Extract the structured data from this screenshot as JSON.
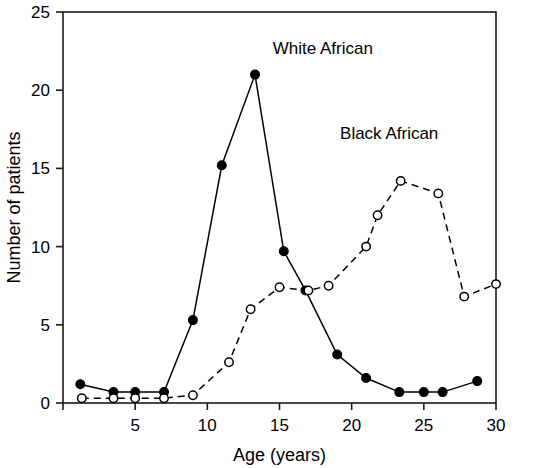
{
  "chart_data": {
    "type": "line",
    "title": "",
    "xlabel": "Age (years)",
    "ylabel": "Number of patients",
    "xlim": [
      0,
      30
    ],
    "ylim": [
      0,
      25
    ],
    "xticks": [
      0,
      5,
      10,
      15,
      20,
      25,
      30
    ],
    "xticklabels": [
      "",
      "5",
      "10",
      "15",
      "20",
      "25",
      "30"
    ],
    "yticks": [
      0,
      5,
      10,
      15,
      20,
      25
    ],
    "yticklabels": [
      "0",
      "5",
      "10",
      "15",
      "20",
      "25"
    ],
    "grid": false,
    "legend_position": "inline-annotations",
    "series": [
      {
        "name": "White African",
        "marker": "filled-circle",
        "linestyle": "solid",
        "color": "#000000",
        "label_x": 18.0,
        "label_y": 22.3,
        "points": [
          {
            "x": 1.2,
            "y": 1.2
          },
          {
            "x": 3.5,
            "y": 0.7
          },
          {
            "x": 5.0,
            "y": 0.7
          },
          {
            "x": 7.0,
            "y": 0.7
          },
          {
            "x": 9.0,
            "y": 5.3
          },
          {
            "x": 11.0,
            "y": 15.2
          },
          {
            "x": 13.3,
            "y": 21.0
          },
          {
            "x": 15.3,
            "y": 9.7
          },
          {
            "x": 16.8,
            "y": 7.2
          },
          {
            "x": 19.0,
            "y": 3.1
          },
          {
            "x": 21.0,
            "y": 1.6
          },
          {
            "x": 23.3,
            "y": 0.7
          },
          {
            "x": 25.0,
            "y": 0.7
          },
          {
            "x": 26.3,
            "y": 0.7
          },
          {
            "x": 28.7,
            "y": 1.4
          }
        ]
      },
      {
        "name": "Black African",
        "marker": "open-circle",
        "linestyle": "dashed",
        "color": "#000000",
        "label_x": 22.6,
        "label_y": 16.9,
        "points": [
          {
            "x": 1.3,
            "y": 0.3
          },
          {
            "x": 3.5,
            "y": 0.3
          },
          {
            "x": 5.0,
            "y": 0.3
          },
          {
            "x": 7.0,
            "y": 0.3
          },
          {
            "x": 9.0,
            "y": 0.5
          },
          {
            "x": 11.5,
            "y": 2.6
          },
          {
            "x": 13.0,
            "y": 6.0
          },
          {
            "x": 15.0,
            "y": 7.4
          },
          {
            "x": 17.0,
            "y": 7.2
          },
          {
            "x": 18.4,
            "y": 7.5
          },
          {
            "x": 21.0,
            "y": 10.0
          },
          {
            "x": 21.8,
            "y": 12.0
          },
          {
            "x": 23.4,
            "y": 14.2
          },
          {
            "x": 26.0,
            "y": 13.4
          },
          {
            "x": 27.8,
            "y": 6.8
          },
          {
            "x": 30.0,
            "y": 7.6
          }
        ]
      }
    ]
  }
}
